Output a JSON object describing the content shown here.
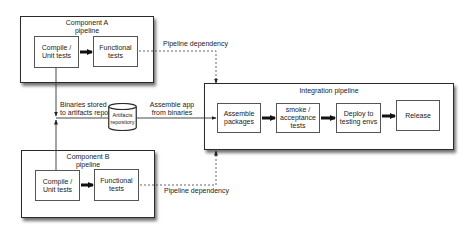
{
  "diagram": {
    "component_a": {
      "title_line1": "Component A",
      "title_line2": "pipeline",
      "stages": [
        {
          "line1": "Compile /",
          "line2": "Unit tests"
        },
        {
          "line1": "Functional",
          "line2": "tests"
        }
      ]
    },
    "component_b": {
      "title_line1": "Component B",
      "title_line2": "pipeline",
      "stages": [
        {
          "line1": "Compile /",
          "line2": "Unit tests"
        },
        {
          "line1": "Functional",
          "line2": "tests"
        }
      ]
    },
    "integration": {
      "title": "Integration pipeline",
      "stages": [
        {
          "line1": "Assemble",
          "line2": "packages",
          "line3": ""
        },
        {
          "line1": "smoke /",
          "line2": "acceptance",
          "line3": "tests"
        },
        {
          "line1": "Deploy to",
          "line2": "testing envs",
          "line3": ""
        },
        {
          "line1": "Release",
          "line2": "",
          "line3": ""
        }
      ]
    },
    "repository": {
      "line1": "Artifacts",
      "line2": "repository"
    },
    "labels": {
      "pipeline_dependency_top": "Pipeline dependency",
      "pipeline_dependency_bottom": "Pipeline dependency",
      "binaries_line1": "Binaries stored",
      "binaries_line2": "to artifacts repo",
      "assemble_line1": "Assemble app",
      "assemble_line2": "from binaries"
    },
    "colors": {
      "line": "#2a2a2a",
      "dashed": "#555555",
      "background": "#ffffff"
    }
  }
}
